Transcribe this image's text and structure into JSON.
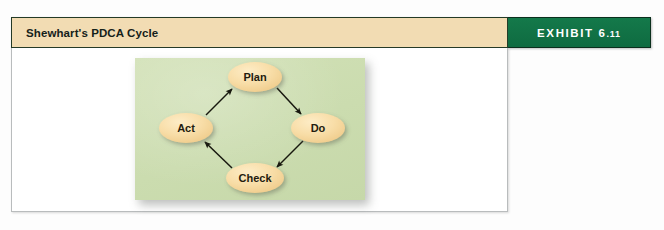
{
  "header": {
    "title": "Shewhart's PDCA Cycle",
    "exhibit_prefix": "EXHIBIT ",
    "exhibit_number_major": "6",
    "exhibit_number_dot": ".",
    "exhibit_number_minor": "11",
    "exhibit_full": "EXHIBIT 6.11"
  },
  "colors": {
    "title_strip_bg": "#f2dcb3",
    "exhibit_tab_bg": "#157347",
    "diagram_panel_bg": "#cfdfb3",
    "node_fill": "#f7dba4",
    "arrow_stroke": "#1a1a14",
    "frame_border": "#b9bcbd"
  },
  "diagram": {
    "type": "cycle-diagram",
    "name": "PDCA Cycle",
    "nodes": [
      {
        "id": "plan",
        "label": "Plan",
        "cx": 120,
        "cy": 19,
        "rx": 27,
        "ry": 15
      },
      {
        "id": "do",
        "label": "Do",
        "cx": 183,
        "cy": 70,
        "rx": 27,
        "ry": 15
      },
      {
        "id": "check",
        "label": "Check",
        "cx": 120,
        "cy": 120,
        "rx": 29,
        "ry": 15
      },
      {
        "id": "act",
        "label": "Act",
        "cx": 51,
        "cy": 70,
        "rx": 27,
        "ry": 15
      }
    ],
    "edges": [
      {
        "from": "plan",
        "to": "do",
        "x1": 142,
        "y1": 30,
        "x2": 166,
        "y2": 56
      },
      {
        "from": "do",
        "to": "check",
        "x1": 168,
        "y1": 83,
        "x2": 142,
        "y2": 109
      },
      {
        "from": "check",
        "to": "act",
        "x1": 97,
        "y1": 110,
        "x2": 70,
        "y2": 84
      },
      {
        "from": "act",
        "to": "plan",
        "x1": 71,
        "y1": 57,
        "x2": 97,
        "y2": 31
      }
    ]
  }
}
